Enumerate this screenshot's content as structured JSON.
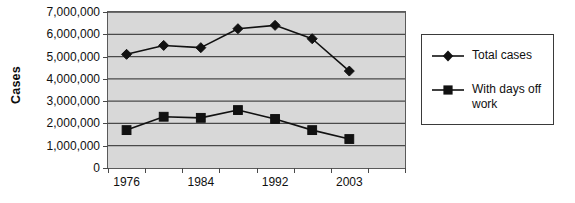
{
  "chart_data": {
    "type": "line",
    "title": "",
    "xlabel": "",
    "ylabel": "Cases",
    "x": [
      1976,
      1980,
      1984,
      1988,
      1992,
      1996,
      2000,
      2003
    ],
    "categories": [
      "1976",
      "1980",
      "1984",
      "1988",
      "1992",
      "1996",
      "2000",
      "2003"
    ],
    "xtick_labels": [
      "1976",
      "1984",
      "1992",
      "2003"
    ],
    "xtick_values": [
      1976,
      1984,
      1992,
      2003
    ],
    "ytick_labels": [
      "7,000,000",
      "6,000,000",
      "5,000,000",
      "4,000,000",
      "3,000,000",
      "2,000,000",
      "1,000,000",
      "0"
    ],
    "ytick_values": [
      7000000,
      6000000,
      5000000,
      4000000,
      3000000,
      2000000,
      1000000,
      0
    ],
    "ylim": [
      0,
      7000000
    ],
    "grid": "horizontal",
    "legend_position": "right",
    "plot_background": "#d8d8d8",
    "series": [
      {
        "name": "Total cases",
        "marker": "diamond",
        "color": "#111111",
        "values": [
          5100000,
          5500000,
          5400000,
          6250000,
          6400000,
          5800000,
          4350000,
          null
        ]
      },
      {
        "name": "With days off work",
        "marker": "square",
        "color": "#111111",
        "values": [
          1700000,
          2300000,
          2250000,
          2600000,
          2200000,
          1700000,
          1300000,
          null
        ]
      }
    ]
  },
  "legend": {
    "items": [
      {
        "label": "Total cases",
        "marker": "diamond"
      },
      {
        "label": "With days off\nwork",
        "marker": "square"
      }
    ]
  }
}
